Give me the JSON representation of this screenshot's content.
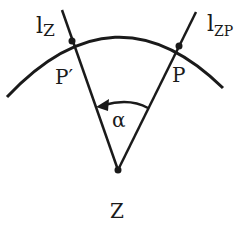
{
  "diagram": {
    "title": "",
    "colors": {
      "stroke": "#1a1a1a",
      "background": "#ffffff"
    },
    "labels": {
      "line_z": "l",
      "line_z_sub": "Z",
      "line_zp": "l",
      "line_zp_sub": "ZP",
      "point_p_prime": "P′",
      "point_p": "P",
      "angle": "α",
      "center": "Z"
    },
    "elements": {
      "arc": "circular arc centered near Z passing through P′ and P",
      "line_z": "ray from Z through P′",
      "line_zp": "ray from Z through P",
      "angle_arrow": "arc with arrowhead rotating from l_ZP toward l_Z"
    }
  }
}
